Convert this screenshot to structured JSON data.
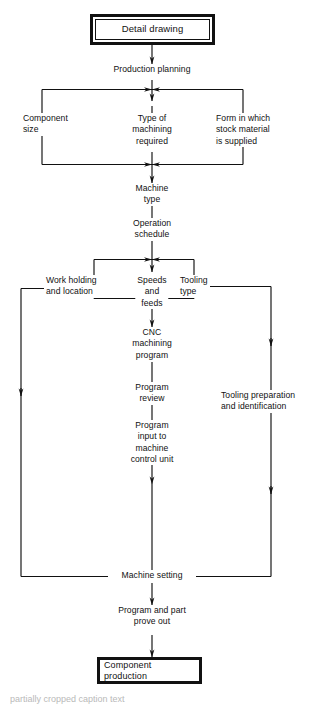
{
  "diagram": {
    "type": "flowchart",
    "terminals": [
      {
        "id": "detail-drawing",
        "label": "Detail drawing"
      },
      {
        "id": "component-production",
        "label": "Component production"
      }
    ],
    "stages": {
      "production_planning": "Production planning",
      "type_of_machining": "Type of\nmachining\nrequired",
      "component_size": "Component\nsize",
      "form_stock_material": "Form in which\nstock material\nis supplied",
      "machine_type": "Machine\ntype",
      "operation_schedule": "Operation\nschedule",
      "work_holding": "Work holding\nand location",
      "speeds_and_feeds": "Speeds\nand\nfeeds",
      "tooling_type": "Tooling\ntype",
      "cnc_machining_program": "CNC\nmachining\nprogram",
      "program_review": "Program\nreview",
      "program_input": "Program\ninput to\nmachine\ncontrol unit",
      "tooling_preparation": "Tooling preparation\nand identification",
      "machine_setting": "Machine setting",
      "prove_out": "Program  and part\nprove out"
    },
    "caption_clipped": "partially cropped caption text"
  },
  "colors": {
    "ink": "#111111",
    "paper": "#ffffff"
  }
}
